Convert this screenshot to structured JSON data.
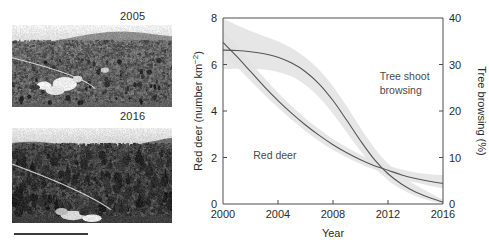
{
  "figure": {
    "photos": [
      {
        "name": "photo-2005",
        "caption": "2005",
        "alt_desc": "hillside-grazed-moorland-grayscale"
      },
      {
        "name": "photo-2016",
        "caption": "2016",
        "alt_desc": "hillside-regenerating-trees-grayscale"
      }
    ],
    "scale_bar": {
      "visible": true
    }
  },
  "chart_data": {
    "type": "line",
    "title": "",
    "xlabel": "Year",
    "ylabel": "Red deer (number km⁻²)",
    "ylabel_right": "Tree browsing (%)",
    "xlim": [
      2000,
      2016
    ],
    "ylim": [
      0,
      8
    ],
    "ylim_right": [
      0,
      40
    ],
    "xticks": [
      2000,
      2004,
      2008,
      2012,
      2016
    ],
    "xticklabels": [
      "2000",
      "2004",
      "2008",
      "2012",
      "2016"
    ],
    "yticks": [
      0,
      2,
      4,
      6,
      8
    ],
    "yticklabels": [
      "0",
      "2",
      "4",
      "6",
      "8"
    ],
    "yticks_right": [
      0,
      10,
      20,
      30,
      40
    ],
    "yticklabels_right": [
      "0",
      "10",
      "20",
      "30",
      "40"
    ],
    "grid": false,
    "legend": "none",
    "annotations": [
      {
        "text": "Red deer",
        "x": 2002.2,
        "y": 1.95,
        "axis": "left"
      },
      {
        "text": "Tree shoot",
        "x": 2011.4,
        "y": 5.35,
        "axis": "left"
      },
      {
        "text": "browsing",
        "x": 2011.4,
        "y": 4.75,
        "axis": "left"
      }
    ],
    "band_color": "#e2e2e2",
    "line_color": "#555555",
    "x": [
      2000,
      2001,
      2002,
      2003,
      2004,
      2005,
      2006,
      2007,
      2008,
      2009,
      2010,
      2011,
      2012,
      2013,
      2014,
      2015,
      2016
    ],
    "series": [
      {
        "name": "Red deer",
        "axis": "left",
        "units": "number km^-2",
        "values": [
          6.95,
          6.35,
          5.7,
          5.05,
          4.45,
          3.9,
          3.4,
          2.95,
          2.55,
          2.2,
          1.9,
          1.65,
          1.45,
          1.25,
          1.1,
          0.98,
          0.88
        ],
        "ci_lower": [
          6.45,
          5.9,
          5.3,
          4.7,
          4.15,
          3.62,
          3.14,
          2.7,
          2.32,
          2.0,
          1.72,
          1.48,
          1.27,
          1.08,
          0.92,
          0.79,
          0.68
        ],
        "ci_upper": [
          7.45,
          6.82,
          6.12,
          5.42,
          4.78,
          4.2,
          3.68,
          3.22,
          2.8,
          2.44,
          2.12,
          1.86,
          1.66,
          1.48,
          1.36,
          1.28,
          1.24
        ]
      },
      {
        "name": "Tree shoot browsing",
        "axis": "right",
        "units": "%",
        "values_left_scale": [
          6.62,
          6.6,
          6.55,
          6.46,
          6.31,
          6.06,
          5.69,
          5.16,
          4.45,
          3.6,
          2.72,
          1.92,
          1.3,
          0.85,
          0.52,
          0.28,
          0.08
        ],
        "values": [
          33.1,
          33.0,
          32.8,
          32.3,
          31.6,
          30.3,
          28.5,
          25.8,
          22.3,
          18.0,
          13.6,
          9.6,
          6.5,
          4.3,
          2.6,
          1.4,
          0.4
        ],
        "ci_lower_left_scale": [
          5.8,
          5.82,
          5.82,
          5.78,
          5.68,
          5.48,
          5.12,
          4.58,
          3.88,
          3.08,
          2.28,
          1.58,
          1.02,
          0.62,
          0.34,
          0.15,
          0.02
        ],
        "ci_upper_left_scale": [
          7.98,
          7.7,
          7.44,
          7.22,
          7.0,
          6.7,
          6.3,
          5.76,
          5.06,
          4.2,
          3.28,
          2.42,
          1.74,
          1.22,
          0.82,
          0.5,
          0.2
        ]
      }
    ]
  }
}
